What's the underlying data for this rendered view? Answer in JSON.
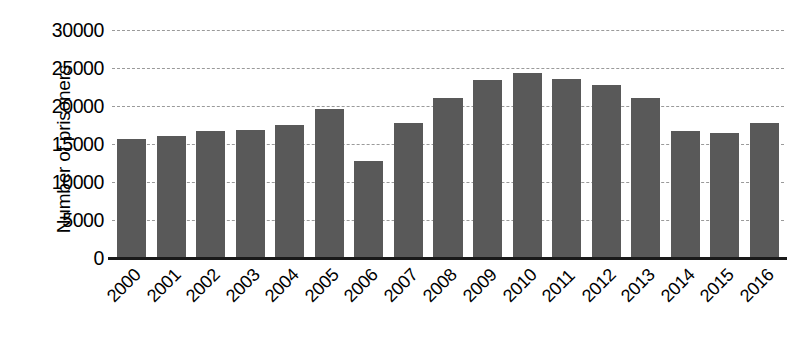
{
  "chart_data": {
    "type": "bar",
    "title": "",
    "xlabel": "",
    "ylabel": "Number of prisoners",
    "categories": [
      "2000",
      "2001",
      "2002",
      "2003",
      "2004",
      "2005",
      "2006",
      "2007",
      "2008",
      "2009",
      "2010",
      "2011",
      "2012",
      "2013",
      "2014",
      "2015",
      "2016"
    ],
    "values": [
      15700,
      16100,
      16700,
      16900,
      17500,
      19600,
      12800,
      17800,
      21000,
      23400,
      24300,
      23500,
      22800,
      21000,
      16700,
      16400,
      17800
    ],
    "ylim": [
      0,
      30000
    ],
    "y_ticks": [
      0,
      5000,
      10000,
      15000,
      20000,
      25000,
      30000
    ],
    "y_tick_labels": [
      "0",
      "5000",
      "10000",
      "15000",
      "20000",
      "25000",
      "30000"
    ],
    "grid": true,
    "grid_axis": "y",
    "legend": false,
    "legend_position": "none",
    "bar_color": "#595959",
    "grid_color": "#9a9a9a",
    "axis_color": "#1a1a1a",
    "background_color": "#ffffff",
    "x_label_rotation": -45
  }
}
